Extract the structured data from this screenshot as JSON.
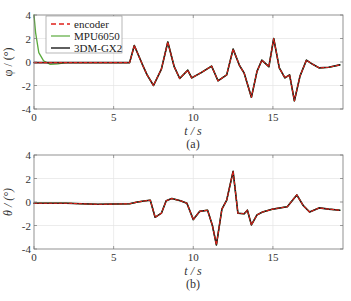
{
  "chart_data": [
    {
      "type": "line",
      "panel_label": "(a)",
      "xlabel": "t / s",
      "ylabel": "φ / (°)",
      "xlim": [
        0,
        19.4
      ],
      "ylim": [
        -4,
        4
      ],
      "xticks": [
        0,
        5,
        10,
        15
      ],
      "yticks": [
        -4,
        -2,
        0,
        2,
        4
      ],
      "grid": true,
      "legend": {
        "position": "upper-left",
        "entries": [
          "encoder",
          "MPU6050",
          "3DM-GX2"
        ]
      },
      "series": [
        {
          "name": "encoder",
          "style": "dashed",
          "color": "#e0201a",
          "x": [
            0,
            1,
            2,
            3,
            4,
            5,
            6,
            6.3,
            6.8,
            7.1,
            7.5,
            8.0,
            8.4,
            8.8,
            9.15,
            9.65,
            9.9,
            10.5,
            11.15,
            11.55,
            12.1,
            12.5,
            12.9,
            13.2,
            13.65,
            14.0,
            14.3,
            14.75,
            15.05,
            15.4,
            15.75,
            16.05,
            16.35,
            16.7,
            17.1,
            17.5,
            17.9,
            18.5,
            19.2
          ],
          "y": [
            -0.05,
            -0.05,
            -0.05,
            -0.05,
            -0.05,
            -0.05,
            -0.05,
            1.4,
            -0.2,
            -1.1,
            -2.0,
            -0.6,
            1.7,
            -0.4,
            -1.4,
            -0.7,
            -1.35,
            -0.9,
            -0.35,
            -1.6,
            -1.1,
            1.1,
            -0.3,
            -0.95,
            -3.0,
            -0.8,
            0.15,
            -0.4,
            2.0,
            -0.5,
            -1.35,
            -1.1,
            -3.3,
            -1.2,
            0.15,
            -0.2,
            -0.5,
            -0.45,
            -0.25
          ]
        },
        {
          "name": "MPU6050",
          "style": "solid",
          "color": "#5aaa3c",
          "x": [
            0,
            0.1,
            0.3,
            0.6,
            1,
            1.5,
            2,
            3,
            4,
            5,
            6,
            6.3,
            6.8,
            7.1,
            7.5,
            8.0,
            8.4,
            8.8,
            9.15,
            9.65,
            9.9,
            10.5,
            11.15,
            11.55,
            12.1,
            12.5,
            12.9,
            13.2,
            13.65,
            14.0,
            14.3,
            14.75,
            15.05,
            15.4,
            15.75,
            16.05,
            16.35,
            16.7,
            17.1,
            17.5,
            17.9,
            18.5,
            19.2
          ],
          "y": [
            4,
            2.5,
            0.8,
            0.1,
            -0.2,
            -0.15,
            -0.05,
            -0.05,
            -0.05,
            -0.05,
            -0.05,
            1.4,
            -0.2,
            -1.1,
            -2.0,
            -0.6,
            1.7,
            -0.4,
            -1.4,
            -0.7,
            -1.35,
            -0.9,
            -0.35,
            -1.6,
            -1.1,
            1.1,
            -0.3,
            -0.95,
            -3.0,
            -0.8,
            0.15,
            -0.4,
            2.0,
            -0.5,
            -1.35,
            -1.1,
            -3.3,
            -1.2,
            0.15,
            -0.2,
            -0.5,
            -0.45,
            -0.25
          ]
        },
        {
          "name": "3DM-GX2",
          "style": "solid",
          "color": "#1a1a1a",
          "x": [
            0,
            1,
            2,
            3,
            4,
            5,
            6,
            6.3,
            6.8,
            7.1,
            7.5,
            8.0,
            8.4,
            8.8,
            9.15,
            9.65,
            9.9,
            10.5,
            11.15,
            11.55,
            12.1,
            12.5,
            12.9,
            13.2,
            13.65,
            14.0,
            14.3,
            14.75,
            15.05,
            15.4,
            15.75,
            16.05,
            16.35,
            16.7,
            17.1,
            17.5,
            17.9,
            18.5,
            19.2
          ],
          "y": [
            -0.05,
            -0.05,
            -0.05,
            -0.05,
            -0.05,
            -0.05,
            -0.05,
            1.4,
            -0.2,
            -1.1,
            -2.0,
            -0.6,
            1.7,
            -0.4,
            -1.4,
            -0.7,
            -1.35,
            -0.9,
            -0.35,
            -1.6,
            -1.1,
            1.1,
            -0.3,
            -0.95,
            -3.0,
            -0.8,
            0.15,
            -0.4,
            2.0,
            -0.5,
            -1.35,
            -1.1,
            -3.3,
            -1.2,
            0.15,
            -0.2,
            -0.5,
            -0.45,
            -0.25
          ]
        }
      ]
    },
    {
      "type": "line",
      "panel_label": "(b)",
      "xlabel": "t / s",
      "ylabel": "θ / (°)",
      "xlim": [
        0,
        19.4
      ],
      "ylim": [
        -4,
        4
      ],
      "xticks": [
        0,
        5,
        10,
        15
      ],
      "yticks": [
        -4,
        -2,
        0,
        2,
        4
      ],
      "grid": true,
      "series": [
        {
          "name": "encoder",
          "style": "dashed",
          "color": "#e0201a",
          "x": [
            0,
            2,
            4,
            6,
            6.5,
            7.0,
            7.3,
            7.6,
            8.0,
            8.3,
            8.65,
            9.2,
            9.6,
            10.0,
            10.4,
            10.9,
            11.2,
            11.45,
            11.8,
            12.1,
            12.5,
            12.8,
            13.2,
            13.4,
            13.65,
            14.0,
            14.35,
            15.0,
            15.9,
            16.5,
            16.9,
            17.3,
            17.9,
            18.5,
            19.2
          ],
          "y": [
            -0.1,
            -0.1,
            -0.2,
            -0.15,
            0.0,
            0.1,
            0.15,
            -1.3,
            -0.95,
            0.1,
            0.3,
            0.1,
            -0.1,
            -1.5,
            -0.8,
            -0.7,
            -2.0,
            -3.65,
            -0.6,
            0.15,
            2.6,
            -0.95,
            -1.0,
            -0.7,
            -1.95,
            -1.1,
            -0.85,
            -0.6,
            -0.4,
            0.6,
            -0.3,
            -0.85,
            -0.5,
            -0.6,
            -0.7
          ]
        },
        {
          "name": "MPU6050",
          "style": "solid",
          "color": "#5aaa3c",
          "x": [
            0,
            2,
            4,
            6,
            6.5,
            7.0,
            7.3,
            7.6,
            8.0,
            8.3,
            8.65,
            9.2,
            9.6,
            10.0,
            10.4,
            10.9,
            11.2,
            11.45,
            11.8,
            12.1,
            12.5,
            12.8,
            13.2,
            13.4,
            13.65,
            14.0,
            14.35,
            15.0,
            15.9,
            16.5,
            16.9,
            17.3,
            17.9,
            18.5,
            19.2
          ],
          "y": [
            -0.1,
            -0.1,
            -0.2,
            -0.15,
            0.0,
            0.1,
            0.15,
            -1.3,
            -0.95,
            0.1,
            0.3,
            0.1,
            -0.1,
            -1.5,
            -0.8,
            -0.7,
            -2.0,
            -3.65,
            -0.6,
            0.15,
            2.6,
            -0.95,
            -1.0,
            -0.7,
            -1.95,
            -1.1,
            -0.85,
            -0.6,
            -0.4,
            0.6,
            -0.3,
            -0.85,
            -0.5,
            -0.6,
            -0.7
          ]
        },
        {
          "name": "3DM-GX2",
          "style": "solid",
          "color": "#1a1a1a",
          "x": [
            0,
            2,
            4,
            6,
            6.5,
            7.0,
            7.3,
            7.6,
            8.0,
            8.3,
            8.65,
            9.2,
            9.6,
            10.0,
            10.4,
            10.9,
            11.2,
            11.45,
            11.8,
            12.1,
            12.5,
            12.8,
            13.2,
            13.4,
            13.65,
            14.0,
            14.35,
            15.0,
            15.9,
            16.5,
            16.9,
            17.3,
            17.9,
            18.5,
            19.2
          ],
          "y": [
            -0.1,
            -0.1,
            -0.2,
            -0.15,
            0.0,
            0.1,
            0.15,
            -1.3,
            -0.95,
            0.1,
            0.3,
            0.1,
            -0.1,
            -1.5,
            -0.8,
            -0.7,
            -2.0,
            -3.65,
            -0.6,
            0.15,
            2.6,
            -0.95,
            -1.0,
            -0.7,
            -1.95,
            -1.1,
            -0.85,
            -0.6,
            -0.4,
            0.6,
            -0.3,
            -0.85,
            -0.5,
            -0.6,
            -0.7
          ]
        }
      ]
    }
  ],
  "panels": [
    {
      "ylabel": "φ / (°)",
      "xlabel": "t / s",
      "caption": "(a)"
    },
    {
      "ylabel": "θ / (°)",
      "xlabel": "t / s",
      "caption": "(b)"
    }
  ],
  "legend": {
    "items": [
      "encoder",
      "MPU6050",
      "3DM-GX2"
    ]
  }
}
